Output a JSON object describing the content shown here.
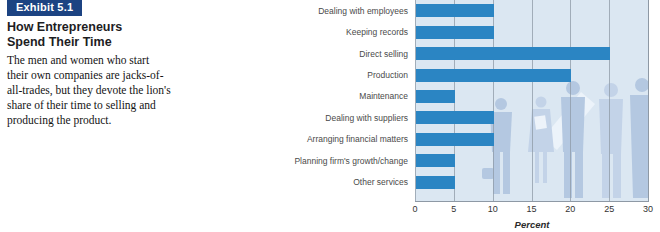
{
  "exhibit": {
    "badge": "Exhibit 5.1",
    "title_lines": [
      "How Entrepreneurs",
      "Spend Their Time"
    ],
    "description_lines": [
      "The men and women who start",
      "their own companies are jacks-of-",
      "all-trades, but they devote the lion's",
      "share of their time to selling and",
      "producing the product."
    ]
  },
  "chart_data": {
    "type": "bar",
    "orientation": "horizontal",
    "categories": [
      "Dealing with employees",
      "Keeping records",
      "Direct selling",
      "Production",
      "Maintenance",
      "Dealing with suppliers",
      "Arranging financial matters",
      "Planning firm's growth/change",
      "Other services"
    ],
    "values": [
      10,
      10,
      25,
      20,
      5,
      10,
      10,
      5,
      5
    ],
    "xlabel": "Percent",
    "ylabel": "",
    "xlim": [
      0,
      30
    ],
    "xticks": [
      0,
      5,
      10,
      15,
      20,
      25,
      30
    ],
    "grid": true,
    "legend": false,
    "bar_color": "#2b85c3",
    "plot_background": "#dbe7f2",
    "background_art": "business-people-silhouettes"
  },
  "colors": {
    "badge_bg": "#1c4382",
    "badge_text": "#ffffff",
    "bar": "#2b85c3",
    "plot_bg": "#dbe7f2",
    "gridline": "#8e99a5",
    "silhouette": "#b4c8e1",
    "silhouette_light": "#c3d3e8"
  }
}
